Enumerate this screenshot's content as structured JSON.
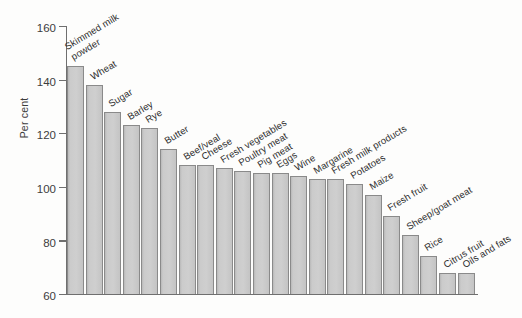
{
  "chart_data": {
    "type": "bar",
    "title": "",
    "subtitle": "",
    "xlabel": "",
    "ylabel": "Per cent",
    "ylim": [
      60,
      160
    ],
    "ytick_step": 20,
    "yticks": [
      160,
      140,
      120,
      100,
      80,
      60
    ],
    "ytick_labels": [
      "160",
      "140",
      "120",
      "100",
      "80",
      "60"
    ],
    "grid": false,
    "legend": false,
    "legend_position": "none",
    "bar_fill_color": "#cccccc",
    "bar_border_color": "#8a8a8a",
    "axis_color": "#6f6f6f",
    "background_color": "#fdfdfc",
    "label_rotation_deg": -31,
    "categories": [
      "Skimmed milk powder",
      "Wheat",
      "Sugar",
      "Barley",
      "Rye",
      "Butter",
      "Beef/veal",
      "Cheese",
      "Fresh vegetables",
      "Poultry meat",
      "Pig meat",
      "Eggs",
      "Wine",
      "Margarine",
      "Fresh milk products",
      "Potatoes",
      "Maize",
      "Fresh fruit",
      "Sheep/goat meat",
      "Rice",
      "Citrus fruit",
      "Oils and fats"
    ],
    "values": [
      145,
      138,
      128,
      123,
      122,
      114,
      108,
      108,
      107,
      106,
      105,
      105,
      104,
      103,
      103,
      101,
      97,
      89,
      82,
      74,
      68,
      68
    ]
  },
  "axis": {
    "y_title": "Per cent"
  }
}
